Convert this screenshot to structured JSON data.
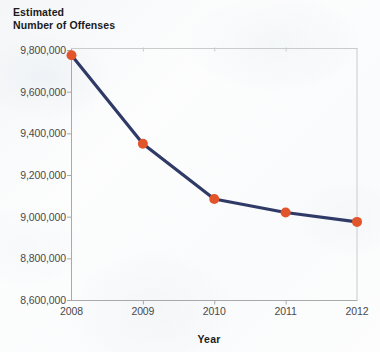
{
  "chart_data": {
    "type": "line",
    "title": "Estimated\nNumber of Offenses",
    "xlabel": "Year",
    "ylabel": "Estimated Number of Offenses",
    "categories": [
      "2008",
      "2009",
      "2010",
      "2011",
      "2012"
    ],
    "x": [
      2008,
      2009,
      2010,
      2011,
      2012
    ],
    "values": [
      9775000,
      9350000,
      9085000,
      9020000,
      8975000
    ],
    "series": [
      {
        "name": "Estimated Number of Offenses",
        "values": [
          9775000,
          9350000,
          9085000,
          9020000,
          8975000
        ]
      }
    ],
    "ylim": [
      8600000,
      9800000
    ],
    "ytick_values": [
      8600000,
      8800000,
      9000000,
      9200000,
      9400000,
      9600000,
      9800000
    ],
    "ytick_labels": [
      "8,600,000",
      "8,800,000",
      "9,000,000",
      "9,200,000",
      "9,400,000",
      "9,600,000",
      "9,800,000"
    ],
    "xtick_labels": [
      "2008",
      "2009",
      "2010",
      "2011",
      "2012"
    ],
    "grid": false,
    "legend": "none",
    "colors": {
      "line": "#2f3a66",
      "marker": "#e2542a",
      "axis": "#a8a9ab",
      "text": "#4a4a4a",
      "title_text": "#1b1b1b",
      "background": "#fdfdfd"
    }
  }
}
